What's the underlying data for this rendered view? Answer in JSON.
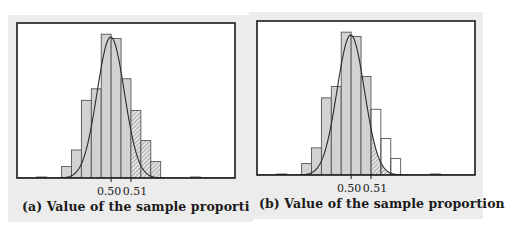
{
  "chart_data": [
    {
      "type": "bar",
      "panel": "a",
      "title": "(a) Value of the sample proportion",
      "xlabel": "(a) Value of the sample proportion",
      "ylabel": "",
      "x_tick_labels": [
        "0.50",
        "0.51"
      ],
      "x_ticks": [
        0.5,
        0.51
      ],
      "xlim": [
        0.4525,
        0.5625
      ],
      "ylim": [
        0,
        105
      ],
      "bin_width": 0.005,
      "bins": [
        {
          "start": 0.4625,
          "value": 0.7
        },
        {
          "start": 0.475,
          "value": 8
        },
        {
          "start": 0.48,
          "value": 19.5
        },
        {
          "start": 0.485,
          "value": 54
        },
        {
          "start": 0.49,
          "value": 62
        },
        {
          "start": 0.495,
          "value": 100
        },
        {
          "start": 0.5,
          "value": 97
        },
        {
          "start": 0.505,
          "value": 69
        },
        {
          "start": 0.51,
          "value": 47
        },
        {
          "start": 0.515,
          "value": 26
        },
        {
          "start": 0.52,
          "value": 11.5
        },
        {
          "start": 0.54,
          "value": 0.7
        }
      ],
      "shaded_from": 0.51,
      "shading": "hatched bars",
      "curve": {
        "type": "normal",
        "mean": 0.4998,
        "sd": 0.0069,
        "peak": 98
      },
      "grid": false,
      "legend": "none"
    },
    {
      "type": "bar",
      "panel": "b",
      "title": "(b) Value of the sample proportion",
      "xlabel": "(b) Value of the sample proportion",
      "ylabel": "",
      "x_tick_labels": [
        "0.50",
        "0.51"
      ],
      "x_ticks": [
        0.5,
        0.51
      ],
      "xlim": [
        0.4525,
        0.5625
      ],
      "ylim": [
        0,
        105
      ],
      "bin_width": 0.005,
      "bins": [
        {
          "start": 0.4625,
          "value": 0.7
        },
        {
          "start": 0.475,
          "value": 8
        },
        {
          "start": 0.48,
          "value": 19
        },
        {
          "start": 0.485,
          "value": 54
        },
        {
          "start": 0.49,
          "value": 62
        },
        {
          "start": 0.495,
          "value": 100
        },
        {
          "start": 0.5,
          "value": 97
        },
        {
          "start": 0.505,
          "value": 69
        },
        {
          "start": 0.51,
          "value": 46
        },
        {
          "start": 0.515,
          "value": 25.5
        },
        {
          "start": 0.52,
          "value": 11.5
        },
        {
          "start": 0.54,
          "value": 0.7
        }
      ],
      "shaded_from": 0.51,
      "shading": "hatched area under curve",
      "curve": {
        "type": "normal",
        "mean": 0.4998,
        "sd": 0.0069,
        "peak": 98
      },
      "grid": false,
      "legend": "none"
    }
  ],
  "colors": {
    "bar_fill": "#d2d2d2",
    "bar_stroke": "#555555",
    "hatch": "#555555",
    "frame": "#1a1a1a",
    "panel_bg": "#ececec",
    "plot_bg": "#ffffff"
  }
}
